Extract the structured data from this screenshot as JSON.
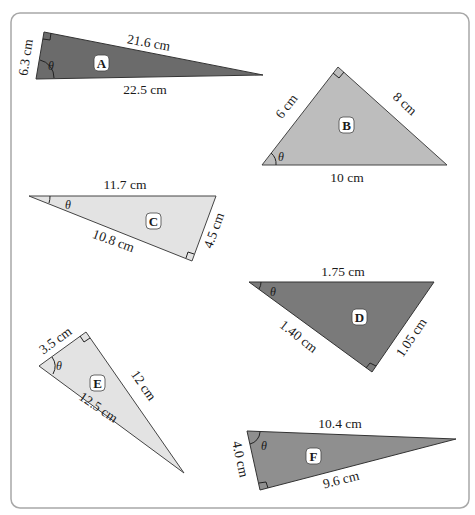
{
  "figure": {
    "frame": {
      "stroke": "#a8a8a8"
    },
    "angle_symbol": "θ",
    "triangles": [
      {
        "id": "A",
        "fill": "#6b6b6b",
        "sides": {
          "side1": "6.3 cm",
          "side2": "21.6 cm",
          "side3": "22.5 cm"
        }
      },
      {
        "id": "B",
        "fill": "#bdbdbd",
        "sides": {
          "side1": "6 cm",
          "side2": "8 cm",
          "side3": "10 cm"
        }
      },
      {
        "id": "C",
        "fill": "#e3e3e3",
        "sides": {
          "side1": "11.7 cm",
          "side2": "10.8 cm",
          "side3": "4.5 cm"
        }
      },
      {
        "id": "D",
        "fill": "#7a7a7a",
        "sides": {
          "side1": "1.75 cm",
          "side2": "1.40 cm",
          "side3": "1.05 cm"
        }
      },
      {
        "id": "E",
        "fill": "#e3e3e3",
        "sides": {
          "side1": "3.5 cm",
          "side2": "12 cm",
          "side3": "12.5 cm"
        }
      },
      {
        "id": "F",
        "fill": "#8f8f8f",
        "sides": {
          "side1": "10.4 cm",
          "side2": "4.0 cm",
          "side3": "9.6 cm"
        }
      }
    ]
  }
}
